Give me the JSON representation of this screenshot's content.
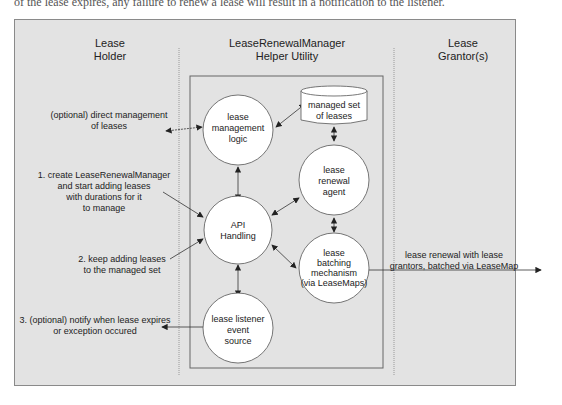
{
  "top_text": "of the lease expires, any failure to renew a lease will result in a notification to the listener.",
  "columns": {
    "left": {
      "line1": "Lease",
      "line2": "Holder"
    },
    "middle": {
      "line1": "LeaseRenewalManager",
      "line2": "Helper Utility"
    },
    "right": {
      "line1": "Lease",
      "line2": "Grantor(s)"
    }
  },
  "nodes": {
    "mgmt": [
      "lease",
      "management",
      "logic"
    ],
    "store": [
      "managed set",
      "of leases"
    ],
    "agent": [
      "lease",
      "renewal",
      "agent"
    ],
    "api": [
      "API",
      "Handling"
    ],
    "batch": [
      "lease",
      "batching",
      "mechanism",
      "(via LeaseMaps)"
    ],
    "listener": [
      "lease listener",
      "event",
      "source"
    ]
  },
  "labels": {
    "direct": [
      "(optional) direct management",
      "of leases"
    ],
    "step1": [
      "1. create LeaseRenewalManager",
      "and start adding leases",
      "with durations for it",
      "to manage"
    ],
    "step2": [
      "2. keep adding leases",
      "to the managed set"
    ],
    "step3": [
      "3. (optional) notify when lease expires",
      "or exception occured"
    ],
    "renewal": [
      "lease renewal with lease",
      "grantors, batched via LeaseMap"
    ]
  },
  "colors": {
    "panel": "#e3e3e3",
    "line": "#333333",
    "node": "#ffffff"
  }
}
